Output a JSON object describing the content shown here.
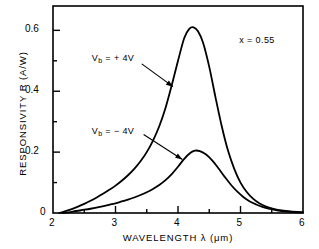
{
  "chart_data": {
    "type": "line",
    "title": "",
    "xlabel": "WAVELENGTH λ (μm)",
    "ylabel": "RESPONSIVITY R (A/W)",
    "xlim": [
      2,
      6
    ],
    "ylim": [
      0,
      0.68
    ],
    "x_ticks": [
      2,
      3,
      4,
      5,
      6
    ],
    "x_tick_labels": [
      "2",
      "3",
      "4",
      "5",
      "6"
    ],
    "x_minor_ticks": [
      2.5,
      3.5,
      4.5,
      5.5
    ],
    "y_ticks": [
      0,
      0.2,
      0.4,
      0.6
    ],
    "y_tick_labels": [
      "0",
      "0.2",
      "0.4",
      "0.6"
    ],
    "y_minor_ticks": [
      0.1,
      0.3,
      0.5
    ],
    "grid": false,
    "legend": "none",
    "series": [
      {
        "name": "V_b = +4V",
        "peak_x": 4.25,
        "peak_y": 0.61,
        "x": [
          2.1,
          2.2,
          2.3,
          2.4,
          2.5,
          2.6,
          2.7,
          2.8,
          2.9,
          3.0,
          3.1,
          3.2,
          3.3,
          3.4,
          3.5,
          3.6,
          3.7,
          3.8,
          3.9,
          4.0,
          4.1,
          4.18,
          4.25,
          4.32,
          4.4,
          4.5,
          4.6,
          4.7,
          4.8,
          4.9,
          5.0,
          5.1,
          5.2,
          5.3,
          5.4,
          5.5,
          5.6,
          5.8,
          6.0
        ],
        "y": [
          0.0,
          0.006,
          0.013,
          0.021,
          0.03,
          0.04,
          0.051,
          0.063,
          0.076,
          0.09,
          0.106,
          0.124,
          0.145,
          0.17,
          0.2,
          0.238,
          0.285,
          0.345,
          0.42,
          0.5,
          0.575,
          0.605,
          0.61,
          0.597,
          0.56,
          0.48,
          0.38,
          0.285,
          0.205,
          0.145,
          0.1,
          0.069,
          0.047,
          0.032,
          0.022,
          0.015,
          0.01,
          0.005,
          0.002
        ]
      },
      {
        "name": "V_b = -4V",
        "peak_x": 4.27,
        "peak_y": 0.205,
        "x": [
          2.15,
          2.3,
          2.45,
          2.6,
          2.75,
          2.9,
          3.0,
          3.1,
          3.2,
          3.3,
          3.4,
          3.5,
          3.6,
          3.7,
          3.8,
          3.9,
          4.0,
          4.1,
          4.2,
          4.27,
          4.35,
          4.45,
          4.55,
          4.65,
          4.75,
          4.85,
          4.95,
          5.05,
          5.15,
          5.25,
          5.35,
          5.45,
          5.6,
          5.8,
          6.0
        ],
        "y": [
          0.0,
          0.004,
          0.009,
          0.014,
          0.02,
          0.027,
          0.032,
          0.038,
          0.044,
          0.051,
          0.059,
          0.068,
          0.079,
          0.092,
          0.108,
          0.128,
          0.152,
          0.178,
          0.198,
          0.205,
          0.203,
          0.192,
          0.172,
          0.146,
          0.118,
          0.092,
          0.07,
          0.052,
          0.038,
          0.028,
          0.02,
          0.014,
          0.008,
          0.004,
          0.002
        ]
      }
    ],
    "annotations": [
      {
        "id": "annot-vb-plus",
        "text_main": "V",
        "text_sub": "b",
        "text_rest": " = + 4V",
        "label": "V_b = + 4V",
        "label_x": 2.62,
        "label_y": 0.505,
        "arrow_from_x": 3.42,
        "arrow_from_y": 0.49,
        "arrow_to_x": 3.92,
        "arrow_to_y": 0.415
      },
      {
        "id": "annot-vb-minus",
        "text_main": "V",
        "text_sub": "b",
        "text_rest": " = − 4V",
        "label": "V_b = − 4V",
        "label_x": 2.62,
        "label_y": 0.265,
        "arrow_from_x": 3.45,
        "arrow_from_y": 0.258,
        "arrow_to_x": 4.07,
        "arrow_to_y": 0.176
      },
      {
        "id": "annot-composition",
        "label": "x = 0.55",
        "label_x": 4.98,
        "label_y": 0.565
      }
    ]
  },
  "colors": {
    "axis": "#000000",
    "curve": "#000000",
    "background": "#ffffff"
  }
}
